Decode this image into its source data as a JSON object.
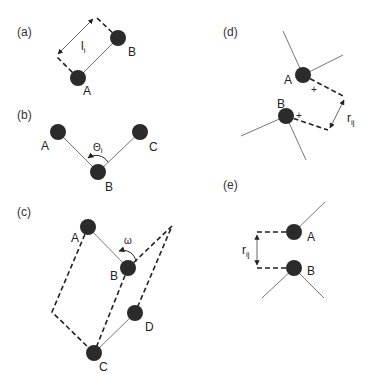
{
  "figure": {
    "colors": {
      "atom": "#2b2b2b",
      "bond": "#777777",
      "dash": "#222222",
      "background": "#ffffff"
    },
    "panels": [
      {
        "id": "a",
        "label": "(a)",
        "meaning": "bond length",
        "atoms": [
          {
            "name": "A",
            "label": "A"
          },
          {
            "name": "B",
            "label": "B"
          }
        ],
        "symbol": "l",
        "symbol_sub": "i"
      },
      {
        "id": "b",
        "label": "(b)",
        "meaning": "bond angle",
        "atoms": [
          {
            "name": "A",
            "label": "A"
          },
          {
            "name": "B",
            "label": "B"
          },
          {
            "name": "C",
            "label": "C"
          }
        ],
        "symbol": "Θ",
        "symbol_sub": "i"
      },
      {
        "id": "c",
        "label": "(c)",
        "meaning": "torsion (dihedral) angle",
        "atoms": [
          {
            "name": "A",
            "label": "A"
          },
          {
            "name": "B",
            "label": "B"
          },
          {
            "name": "C",
            "label": "C"
          },
          {
            "name": "D",
            "label": "D"
          }
        ],
        "symbol": "ω"
      },
      {
        "id": "d",
        "label": "(d)",
        "meaning": "electrostatic interaction between charges",
        "atoms": [
          {
            "name": "A",
            "label": "A",
            "charge": "+"
          },
          {
            "name": "B",
            "label": "B",
            "charge": "+"
          }
        ],
        "symbol": "r",
        "symbol_sub": "ij"
      },
      {
        "id": "e",
        "label": "(e)",
        "meaning": "van der Waals interaction distance",
        "atoms": [
          {
            "name": "A",
            "label": "A"
          },
          {
            "name": "B",
            "label": "B"
          }
        ],
        "symbol": "r",
        "symbol_sub": "ij"
      }
    ]
  }
}
